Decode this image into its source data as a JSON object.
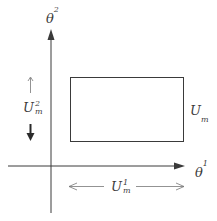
{
  "diagram": {
    "axes": {
      "x_label": {
        "base": "θ",
        "sup": "1"
      },
      "y_label": {
        "base": "θ",
        "sup": "2"
      }
    },
    "region": {
      "label": {
        "base": "U",
        "sub": "m"
      }
    },
    "interval_x": {
      "label": {
        "base": "U",
        "sup": "1",
        "sub": "m"
      }
    },
    "interval_y": {
      "label": {
        "base": "U",
        "sup": "2",
        "sub": "m"
      }
    },
    "colors": {
      "line": "#3a3a3a",
      "background": "#ffffff"
    }
  }
}
